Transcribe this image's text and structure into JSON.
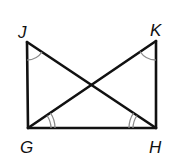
{
  "diagram": {
    "type": "geometry",
    "colors": {
      "stroke": "#111111",
      "arc": "#8a8a8a",
      "background": "#ffffff"
    },
    "points": {
      "J": {
        "label": "J",
        "x": 27,
        "y": 42
      },
      "K": {
        "label": "K",
        "x": 156,
        "y": 41
      },
      "G": {
        "label": "G",
        "x": 28,
        "y": 128
      },
      "H": {
        "label": "H",
        "x": 156,
        "y": 128
      }
    },
    "segments": [
      {
        "from": "J",
        "to": "G"
      },
      {
        "from": "K",
        "to": "H"
      },
      {
        "from": "G",
        "to": "H"
      },
      {
        "from": "J",
        "to": "H"
      },
      {
        "from": "G",
        "to": "K"
      }
    ],
    "angle_marks": [
      {
        "vertex": "J",
        "angle": "GJH",
        "arcs": 1
      },
      {
        "vertex": "K",
        "angle": "HKG",
        "arcs": 1
      },
      {
        "vertex": "G",
        "angle": "KGH",
        "arcs": 2
      },
      {
        "vertex": "H",
        "angle": "JHG",
        "arcs": 2
      }
    ],
    "labels": {
      "J": "J",
      "K": "K",
      "G": "G",
      "H": "H"
    }
  }
}
